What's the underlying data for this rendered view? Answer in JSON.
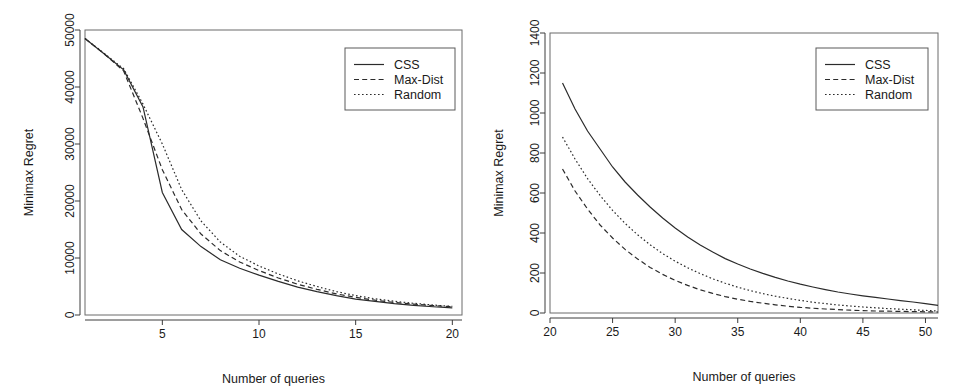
{
  "figure": {
    "background": "#ffffff",
    "line_color": "#2b2b2b",
    "panel_count": 2
  },
  "chart_data": [
    {
      "type": "line",
      "panel": "left",
      "title": "",
      "xlabel": "Number of queries",
      "ylabel": "Minimax Regret",
      "xlim": [
        1,
        20.5
      ],
      "ylim": [
        0,
        50000
      ],
      "xticks": [
        5,
        10,
        15,
        20
      ],
      "yticks": [
        0,
        10000,
        20000,
        30000,
        40000,
        50000
      ],
      "xticklabels": [
        "5",
        "10",
        "15",
        "20"
      ],
      "yticklabels": [
        "0",
        "10000",
        "20000",
        "30000",
        "40000",
        "50000"
      ],
      "grid": false,
      "legend_position": "top-right",
      "legend_entries": [
        "CSS",
        "Max-Dist",
        "Random"
      ],
      "x": [
        1,
        2,
        3,
        4,
        5,
        6,
        7,
        8,
        9,
        10,
        11,
        12,
        13,
        14,
        15,
        16,
        17,
        18,
        19,
        20
      ],
      "series": [
        {
          "name": "CSS",
          "style": "solid",
          "values": [
            48500,
            45800,
            43000,
            36500,
            21500,
            15000,
            12000,
            9700,
            8200,
            7000,
            5900,
            4900,
            4100,
            3400,
            2800,
            2400,
            2000,
            1700,
            1450,
            1250
          ]
        },
        {
          "name": "Max-Dist",
          "style": "dashed",
          "values": [
            48500,
            45800,
            42800,
            34500,
            25500,
            18500,
            14200,
            11300,
            9300,
            7800,
            6500,
            5400,
            4500,
            3700,
            3100,
            2600,
            2200,
            1900,
            1650,
            1450
          ]
        },
        {
          "name": "Random",
          "style": "dotted",
          "values": [
            48500,
            45900,
            43200,
            37000,
            30000,
            22000,
            16500,
            12800,
            10300,
            8600,
            7200,
            6000,
            5000,
            4100,
            3400,
            2850,
            2400,
            2050,
            1750,
            1500
          ]
        }
      ]
    },
    {
      "type": "line",
      "panel": "right",
      "title": "",
      "xlabel": "Number of queries",
      "ylabel": "Minimax Regret",
      "xlim": [
        20,
        51
      ],
      "ylim": [
        0,
        1400
      ],
      "xticks": [
        20,
        25,
        30,
        35,
        40,
        45,
        50
      ],
      "yticks": [
        0,
        200,
        400,
        600,
        800,
        1000,
        1200,
        1400
      ],
      "xticklabels": [
        "20",
        "25",
        "30",
        "35",
        "40",
        "45",
        "50"
      ],
      "yticklabels": [
        "0",
        "200",
        "400",
        "600",
        "800",
        "1000",
        "1200",
        "1400"
      ],
      "grid": false,
      "legend_position": "top-right",
      "legend_entries": [
        "CSS",
        "Max-Dist",
        "Random"
      ],
      "x": [
        21,
        22,
        23,
        24,
        25,
        26,
        27,
        28,
        29,
        30,
        31,
        32,
        33,
        34,
        35,
        36,
        37,
        38,
        39,
        40,
        41,
        42,
        43,
        44,
        45,
        46,
        47,
        48,
        49,
        50,
        51
      ],
      "series": [
        {
          "name": "CSS",
          "style": "solid",
          "values": [
            1150,
            1020,
            910,
            820,
            730,
            655,
            590,
            530,
            475,
            425,
            380,
            340,
            305,
            272,
            245,
            220,
            198,
            178,
            160,
            144,
            130,
            117,
            105,
            95,
            86,
            78,
            70,
            62,
            55,
            47,
            38
          ]
        },
        {
          "name": "Max-Dist",
          "style": "dashed",
          "values": [
            720,
            610,
            520,
            440,
            375,
            318,
            270,
            228,
            193,
            163,
            138,
            116,
            98,
            82,
            69,
            58,
            49,
            41,
            34,
            28,
            24,
            20,
            17,
            14,
            12,
            10,
            9,
            8,
            7,
            6,
            5
          ]
        },
        {
          "name": "Random",
          "style": "dotted",
          "values": [
            880,
            770,
            672,
            588,
            513,
            448,
            391,
            341,
            297,
            259,
            226,
            197,
            171,
            149,
            129,
            112,
            97,
            84,
            73,
            63,
            54,
            47,
            40,
            35,
            30,
            26,
            22,
            19,
            16,
            13,
            10
          ]
        }
      ]
    }
  ],
  "panels": {
    "left": {
      "name": "left-panel",
      "xlabel": "Number of queries",
      "ylabel": "Minimax Regret",
      "legend": {
        "items": [
          {
            "label": "CSS",
            "style": "solid"
          },
          {
            "label": "Max-Dist",
            "style": "dashed"
          },
          {
            "label": "Random",
            "style": "dotted"
          }
        ]
      }
    },
    "right": {
      "name": "right-panel",
      "xlabel": "Number of queries",
      "ylabel": "Minimax Regret",
      "legend": {
        "items": [
          {
            "label": "CSS",
            "style": "solid"
          },
          {
            "label": "Max-Dist",
            "style": "dashed"
          },
          {
            "label": "Random",
            "style": "dotted"
          }
        ]
      }
    }
  }
}
